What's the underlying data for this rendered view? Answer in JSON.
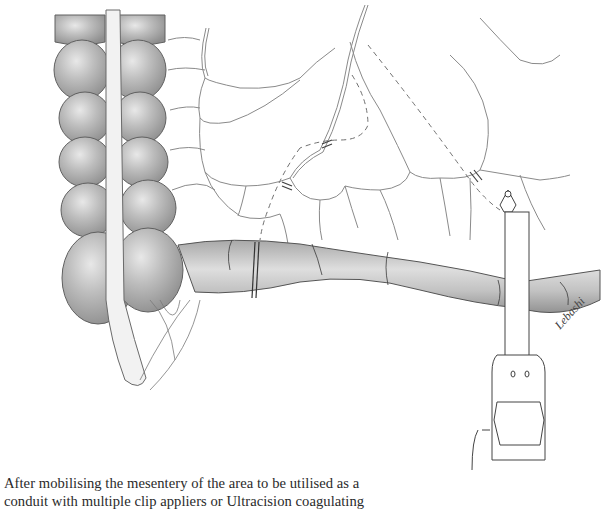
{
  "figure": {
    "signature": "Lebashi",
    "colors": {
      "stroke": "#5a5a5a",
      "bowel_fill": "#b9b9b9",
      "bowel_highlight": "#e6e6e6",
      "vessel_fill": "#f4f4f4"
    }
  },
  "caption": {
    "line1": "After mobilising the mesentery of the area to be utilised as a",
    "line2": "conduit with multiple clip appliers or Ultracision coagulating"
  }
}
